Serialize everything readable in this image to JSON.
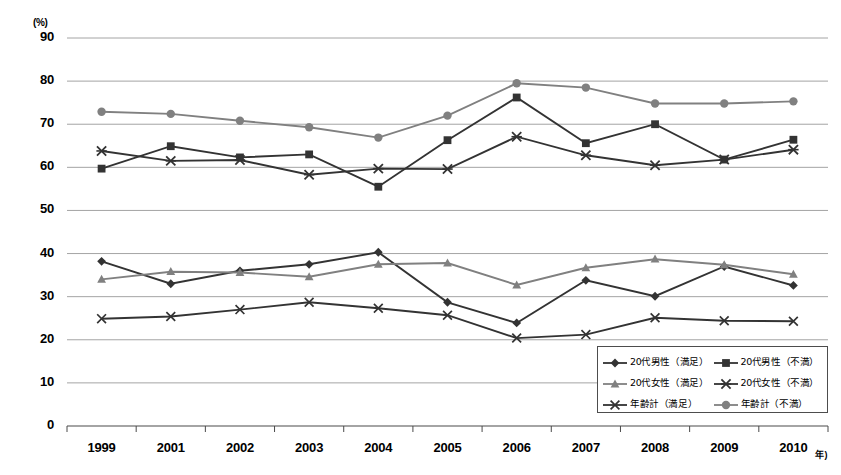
{
  "chart_data": {
    "type": "line",
    "title": "",
    "xlabel": "年",
    "ylabel": "(%)",
    "ylim": [
      0,
      90
    ],
    "ytick_step": 10,
    "grid": true,
    "legend_position": "inside-bottom-right",
    "categories": [
      "1999",
      "2001",
      "2002",
      "2003",
      "2004",
      "2005",
      "2006",
      "2007",
      "2008",
      "2009",
      "2010"
    ],
    "yticks": [
      "0",
      "10",
      "20",
      "30",
      "40",
      "50",
      "60",
      "70",
      "80",
      "90"
    ],
    "series": [
      {
        "name": "20代男性（満足）",
        "marker": "diamond",
        "color": "#333333",
        "values": [
          38.2,
          33.0,
          36.0,
          37.5,
          40.3,
          28.7,
          23.9,
          33.8,
          30.1,
          37.0,
          32.6
        ]
      },
      {
        "name": "20代男性（不満）",
        "marker": "square",
        "color": "#333333",
        "values": [
          59.7,
          64.9,
          62.3,
          63.0,
          55.5,
          66.3,
          76.2,
          65.6,
          70.0,
          61.8,
          66.4
        ]
      },
      {
        "name": "20代女性（満足）",
        "marker": "triangle",
        "color": "#808080",
        "values": [
          34.0,
          35.8,
          35.6,
          34.6,
          37.5,
          37.8,
          32.7,
          36.7,
          38.7,
          37.4,
          35.2
        ]
      },
      {
        "name": "20代女性（不満）",
        "marker": "cross",
        "color": "#333333",
        "values": [
          63.8,
          61.5,
          61.7,
          58.3,
          59.7,
          59.6,
          67.1,
          62.8,
          60.5,
          61.8,
          64.1
        ]
      },
      {
        "name": "年齢計（満足）",
        "marker": "dash",
        "color": "#333333",
        "values": [
          24.9,
          25.4,
          27.0,
          28.7,
          27.3,
          25.7,
          20.4,
          21.2,
          25.1,
          24.4,
          24.3
        ]
      },
      {
        "name": "年齢計（不満）",
        "marker": "circle",
        "color": "#808080",
        "values": [
          72.9,
          72.4,
          70.8,
          69.3,
          66.9,
          72.0,
          79.5,
          78.5,
          74.8,
          74.8,
          75.3
        ]
      }
    ]
  },
  "legend": {
    "items": [
      {
        "label": "20代男性（満足）"
      },
      {
        "label": "20代男性（不満）"
      },
      {
        "label": "20代女性（満足）"
      },
      {
        "label": "20代女性（不満）"
      },
      {
        "label": "年齢計（満足）"
      },
      {
        "label": "年齢計（不満）"
      }
    ]
  },
  "axis": {
    "unit_top": "(%)",
    "unit_right": "年)"
  }
}
